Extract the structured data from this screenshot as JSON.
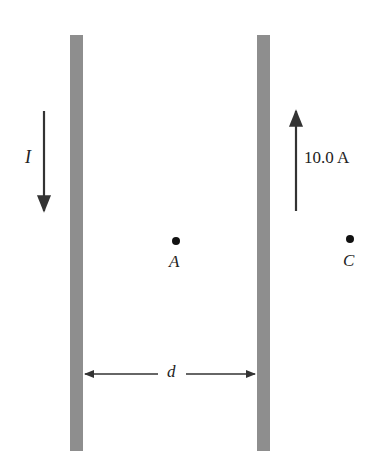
{
  "diagram": {
    "wires": [
      {
        "name": "left-wire",
        "current_label": "I",
        "direction": "down"
      },
      {
        "name": "right-wire",
        "current_label": "10.0 A",
        "direction": "up"
      }
    ],
    "points": [
      {
        "label": "A",
        "position": "between wires"
      },
      {
        "label": "C",
        "position": "right of right wire"
      }
    ],
    "separation_label": "d",
    "colors": {
      "wire": "#8e8e8e",
      "arrow": "#333333",
      "text": "#222222"
    }
  }
}
